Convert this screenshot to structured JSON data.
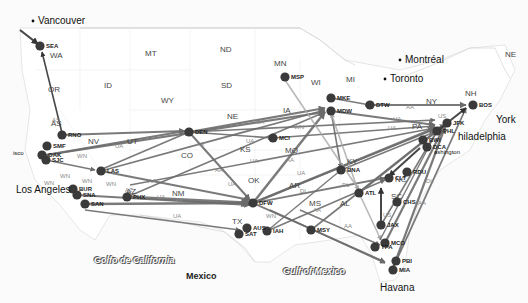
{
  "map": {
    "title": "US airline route network",
    "colors": {
      "route": "#6b6b6b",
      "route_dark": "#333333",
      "route_light": "#a8a8a8",
      "airport": "#3a3a3a",
      "border": "#cfcfcf"
    },
    "states": [
      {
        "label": "WA",
        "x": 50,
        "y": 52
      },
      {
        "label": "OR",
        "x": 48,
        "y": 86
      },
      {
        "label": "ID",
        "x": 104,
        "y": 82
      },
      {
        "label": "MT",
        "x": 145,
        "y": 50
      },
      {
        "label": "ND",
        "x": 220,
        "y": 46
      },
      {
        "label": "SD",
        "x": 221,
        "y": 82
      },
      {
        "label": "WY",
        "x": 161,
        "y": 97
      },
      {
        "label": "MN",
        "x": 274,
        "y": 60
      },
      {
        "label": "WI",
        "x": 311,
        "y": 79
      },
      {
        "label": "MI",
        "x": 346,
        "y": 76
      },
      {
        "label": "NE",
        "x": 227,
        "y": 113
      },
      {
        "label": "IA",
        "x": 283,
        "y": 107
      },
      {
        "label": "UT",
        "x": 127,
        "y": 138
      },
      {
        "label": "NV",
        "x": 88,
        "y": 138
      },
      {
        "label": "CO",
        "x": 181,
        "y": 152
      },
      {
        "label": "KS",
        "x": 240,
        "y": 146
      },
      {
        "label": "MO",
        "x": 285,
        "y": 147
      },
      {
        "label": "OK",
        "x": 248,
        "y": 177
      },
      {
        "label": "AR",
        "x": 289,
        "y": 182
      },
      {
        "label": "AZ",
        "x": 126,
        "y": 188
      },
      {
        "label": "NM",
        "x": 172,
        "y": 190
      },
      {
        "label": "TX",
        "x": 232,
        "y": 218
      },
      {
        "label": "MS",
        "x": 309,
        "y": 200
      },
      {
        "label": "AL",
        "x": 340,
        "y": 200
      },
      {
        "label": "KY",
        "x": 347,
        "y": 158
      },
      {
        "label": "SC",
        "x": 391,
        "y": 193
      },
      {
        "label": "NY",
        "x": 426,
        "y": 98
      },
      {
        "label": "PA",
        "x": 412,
        "y": 123
      },
      {
        "label": "NH",
        "x": 465,
        "y": 90
      },
      {
        "label": "NE",
        "x": 505,
        "y": 51
      },
      {
        "label": "AS",
        "x": 51,
        "y": 120
      },
      {
        "label": "NC",
        "x": 395,
        "y": 176
      }
    ],
    "cities": [
      {
        "label": "Vancouver",
        "x": 38,
        "y": 21,
        "dot": true
      },
      {
        "label": "Montréal",
        "x": 405,
        "y": 60,
        "dot": true
      },
      {
        "label": "Toronto",
        "x": 390,
        "y": 79,
        "dot": true
      },
      {
        "label": "York",
        "x": 496,
        "y": 120
      },
      {
        "label": "hiladelphia",
        "x": 458,
        "y": 137
      },
      {
        "label": "ashington",
        "x": 434,
        "y": 154,
        "small": true
      },
      {
        "label": "isco",
        "x": 13,
        "y": 155,
        "small": true
      },
      {
        "label": "Los Angeles",
        "x": 16,
        "y": 190
      },
      {
        "label": "Havana",
        "x": 380,
        "y": 288
      }
    ],
    "water": [
      {
        "label": "Golfo de California",
        "x": 94,
        "y": 256
      },
      {
        "label": "Gulf of Mexico",
        "x": 283,
        "y": 267
      }
    ],
    "countries": [
      {
        "label": "Mexico",
        "x": 186,
        "y": 272
      }
    ],
    "airports": [
      {
        "code": "SEA",
        "x": 40,
        "y": 46
      },
      {
        "code": "RNO",
        "x": 62,
        "y": 135
      },
      {
        "code": "SMF",
        "x": 47,
        "y": 146
      },
      {
        "code": "OAK",
        "x": 42,
        "y": 155
      },
      {
        "code": "SJC",
        "x": 46,
        "y": 160
      },
      {
        "code": "LAS",
        "x": 101,
        "y": 171
      },
      {
        "code": "BUR",
        "x": 73,
        "y": 189
      },
      {
        "code": "SNA",
        "x": 77,
        "y": 195
      },
      {
        "code": "SAN",
        "x": 85,
        "y": 204
      },
      {
        "code": "PHX",
        "x": 127,
        "y": 197
      },
      {
        "code": "DEN",
        "x": 189,
        "y": 132
      },
      {
        "code": "MCI",
        "x": 273,
        "y": 138
      },
      {
        "code": "MSP",
        "x": 285,
        "y": 77
      },
      {
        "code": "MKE",
        "x": 331,
        "y": 98
      },
      {
        "code": "MDW",
        "x": 331,
        "y": 111
      },
      {
        "code": "DTW",
        "x": 370,
        "y": 105
      },
      {
        "code": "BOS",
        "x": 473,
        "y": 105
      },
      {
        "code": "JFK",
        "x": 447,
        "y": 123
      },
      {
        "code": "PHL",
        "x": 437,
        "y": 131
      },
      {
        "code": "BWI",
        "x": 423,
        "y": 140
      },
      {
        "code": "DCA",
        "x": 427,
        "y": 147
      },
      {
        "code": "BNA",
        "x": 341,
        "y": 170
      },
      {
        "code": "RDU",
        "x": 407,
        "y": 172
      },
      {
        "code": "CLT",
        "x": 389,
        "y": 178
      },
      {
        "code": "ATL",
        "x": 359,
        "y": 193
      },
      {
        "code": "CHS",
        "x": 397,
        "y": 202
      },
      {
        "code": "JAX",
        "x": 381,
        "y": 225
      },
      {
        "code": "MCO",
        "x": 385,
        "y": 243
      },
      {
        "code": "TPA",
        "x": 375,
        "y": 247
      },
      {
        "code": "PBI",
        "x": 396,
        "y": 261
      },
      {
        "code": "MIA",
        "x": 393,
        "y": 270
      },
      {
        "code": "DFW",
        "x": 253,
        "y": 203
      },
      {
        "code": "AUS",
        "x": 247,
        "y": 228
      },
      {
        "code": "SAT",
        "x": 239,
        "y": 234
      },
      {
        "code": "IAH",
        "x": 267,
        "y": 231
      },
      {
        "code": "MSY",
        "x": 311,
        "y": 230
      }
    ],
    "carrier_labels": [
      {
        "label": "AS",
        "x": 52,
        "y": 117
      },
      {
        "label": "UA",
        "x": 115,
        "y": 143
      },
      {
        "label": "WN",
        "x": 77,
        "y": 153
      },
      {
        "label": "WN",
        "x": 60,
        "y": 173
      },
      {
        "label": "WN",
        "x": 44,
        "y": 180
      },
      {
        "label": "WN",
        "x": 82,
        "y": 178
      },
      {
        "label": "WN",
        "x": 106,
        "y": 181
      },
      {
        "label": "AA",
        "x": 148,
        "y": 178
      },
      {
        "label": "AZ",
        "x": 125,
        "y": 187
      },
      {
        "label": "UA",
        "x": 157,
        "y": 194
      },
      {
        "label": "AA",
        "x": 175,
        "y": 197
      },
      {
        "label": "UA",
        "x": 173,
        "y": 213
      },
      {
        "label": "UA",
        "x": 256,
        "y": 119
      },
      {
        "label": "AA",
        "x": 196,
        "y": 141
      },
      {
        "label": "UA",
        "x": 246,
        "y": 138
      },
      {
        "label": "WN",
        "x": 294,
        "y": 124
      },
      {
        "label": "UA",
        "x": 250,
        "y": 158
      },
      {
        "label": "AA",
        "x": 286,
        "y": 157
      },
      {
        "label": "UA",
        "x": 297,
        "y": 170
      },
      {
        "label": "AA",
        "x": 215,
        "y": 167
      },
      {
        "label": "UA",
        "x": 228,
        "y": 181
      },
      {
        "label": "DL",
        "x": 300,
        "y": 188
      },
      {
        "label": "UA",
        "x": 393,
        "y": 116
      },
      {
        "label": "UA",
        "x": 388,
        "y": 125
      },
      {
        "label": "AA",
        "x": 406,
        "y": 104
      },
      {
        "label": "US",
        "x": 438,
        "y": 113
      },
      {
        "label": "US",
        "x": 383,
        "y": 212
      },
      {
        "label": "AA",
        "x": 418,
        "y": 200
      },
      {
        "label": "WN",
        "x": 266,
        "y": 213
      },
      {
        "label": "DL",
        "x": 342,
        "y": 182
      },
      {
        "label": "AA",
        "x": 313,
        "y": 207
      },
      {
        "label": "AA",
        "x": 344,
        "y": 223
      },
      {
        "label": "DL",
        "x": 426,
        "y": 178
      }
    ],
    "routes": [
      {
        "from": [
          20,
          30
        ],
        "to": [
          38,
          44
        ],
        "w": 2.2,
        "c": "dark"
      },
      {
        "from": [
          62,
          133
        ],
        "to": [
          42,
          52
        ],
        "w": 1.6,
        "c": "dark"
      },
      {
        "from": [
          62,
          135
        ],
        "to": [
          185,
          131
        ],
        "w": 2,
        "c": "mid"
      },
      {
        "from": [
          46,
          155
        ],
        "to": [
          185,
          131
        ],
        "w": 2,
        "c": "mid"
      },
      {
        "from": [
          46,
          160
        ],
        "to": [
          95,
          170
        ],
        "w": 1.6,
        "c": "mid"
      },
      {
        "from": [
          46,
          155
        ],
        "to": [
          325,
          112
        ],
        "w": 2.2,
        "c": "mid"
      },
      {
        "from": [
          101,
          171
        ],
        "to": [
          325,
          110
        ],
        "w": 1.8,
        "c": "mid"
      },
      {
        "from": [
          101,
          171
        ],
        "to": [
          250,
          200
        ],
        "w": 2,
        "c": "mid"
      },
      {
        "from": [
          85,
          204
        ],
        "to": [
          250,
          203
        ],
        "w": 2.4,
        "c": "mid"
      },
      {
        "from": [
          127,
          197
        ],
        "to": [
          250,
          203
        ],
        "w": 3,
        "c": "mid"
      },
      {
        "from": [
          77,
          195
        ],
        "to": [
          250,
          205
        ],
        "w": 2,
        "c": "mid"
      },
      {
        "from": [
          127,
          197
        ],
        "to": [
          325,
          112
        ],
        "w": 1.6,
        "c": "mid"
      },
      {
        "from": [
          85,
          210
        ],
        "to": [
          240,
          230
        ],
        "w": 1.6,
        "c": "mid"
      },
      {
        "from": [
          189,
          132
        ],
        "to": [
          250,
          200
        ],
        "w": 2,
        "c": "mid"
      },
      {
        "from": [
          189,
          132
        ],
        "to": [
          325,
          108
        ],
        "w": 2.2,
        "c": "mid"
      },
      {
        "from": [
          189,
          132
        ],
        "to": [
          435,
          120
        ],
        "w": 1.6,
        "c": "mid"
      },
      {
        "from": [
          100,
          170
        ],
        "to": [
          189,
          132
        ],
        "w": 1.6,
        "c": "mid"
      },
      {
        "from": [
          189,
          132
        ],
        "to": [
          273,
          138
        ],
        "w": 1.6,
        "c": "mid"
      },
      {
        "from": [
          130,
          185
        ],
        "to": [
          435,
          128
        ],
        "w": 1.6,
        "c": "mid"
      },
      {
        "from": [
          273,
          138
        ],
        "to": [
          435,
          126
        ],
        "w": 1.6,
        "c": "mid"
      },
      {
        "from": [
          253,
          203
        ],
        "to": [
          325,
          112
        ],
        "w": 2.4,
        "c": "mid"
      },
      {
        "from": [
          253,
          203
        ],
        "to": [
          435,
          128
        ],
        "w": 2.4,
        "c": "mid"
      },
      {
        "from": [
          253,
          203
        ],
        "to": [
          445,
          125
        ],
        "w": 1.8,
        "c": "mid"
      },
      {
        "from": [
          253,
          203
        ],
        "to": [
          385,
          178
        ],
        "w": 1.8,
        "c": "mid"
      },
      {
        "from": [
          253,
          203
        ],
        "to": [
          385,
          262
        ],
        "w": 1.8,
        "c": "mid"
      },
      {
        "from": [
          267,
          231
        ],
        "to": [
          385,
          180
        ],
        "w": 1.6,
        "c": "mid"
      },
      {
        "from": [
          311,
          230
        ],
        "to": [
          440,
          128
        ],
        "w": 1.6,
        "c": "mid"
      },
      {
        "from": [
          267,
          231
        ],
        "to": [
          341,
          170
        ],
        "w": 1.4,
        "c": "mid"
      },
      {
        "from": [
          331,
          111
        ],
        "to": [
          435,
          125
        ],
        "w": 2.2,
        "c": "mid"
      },
      {
        "from": [
          331,
          98
        ],
        "to": [
          370,
          105
        ],
        "w": 1.6,
        "c": "mid"
      },
      {
        "from": [
          370,
          105
        ],
        "to": [
          466,
          105
        ],
        "w": 2.2,
        "c": "mid"
      },
      {
        "from": [
          331,
          111
        ],
        "to": [
          341,
          168
        ],
        "w": 1.6,
        "c": "mid"
      },
      {
        "from": [
          285,
          80
        ],
        "to": [
          359,
          190
        ],
        "w": 1.6,
        "c": "light"
      },
      {
        "from": [
          341,
          170
        ],
        "to": [
          437,
          131
        ],
        "w": 1.6,
        "c": "mid"
      },
      {
        "from": [
          359,
          193
        ],
        "to": [
          437,
          131
        ],
        "w": 1.8,
        "c": "mid"
      },
      {
        "from": [
          359,
          193
        ],
        "to": [
          331,
          113
        ],
        "w": 1.6,
        "c": "light"
      },
      {
        "from": [
          385,
          243
        ],
        "to": [
          445,
          125
        ],
        "w": 2.2,
        "c": "mid"
      },
      {
        "from": [
          393,
          268
        ],
        "to": [
          445,
          127
        ],
        "w": 2.2,
        "c": "mid"
      },
      {
        "from": [
          393,
          268
        ],
        "to": [
          466,
          108
        ],
        "w": 1.8,
        "c": "mid"
      },
      {
        "from": [
          420,
          148
        ],
        "to": [
          389,
          176
        ],
        "w": 2,
        "c": "dark"
      },
      {
        "from": [
          381,
          225
        ],
        "to": [
          381,
          188
        ],
        "w": 2,
        "c": "dark"
      },
      {
        "from": [
          437,
          131
        ],
        "to": [
          466,
          108
        ],
        "w": 2,
        "c": "dark"
      },
      {
        "from": [
          300,
          210
        ],
        "to": [
          380,
          245
        ],
        "w": 1.6,
        "c": "mid"
      },
      {
        "from": [
          270,
          210
        ],
        "to": [
          385,
          263
        ],
        "w": 1.6,
        "c": "mid"
      },
      {
        "from": [
          359,
          193
        ],
        "to": [
          381,
          240
        ],
        "w": 1.6,
        "c": "light"
      },
      {
        "from": [
          437,
          131
        ],
        "to": [
          381,
          225
        ],
        "w": 1.6,
        "c": "mid"
      },
      {
        "from": [
          380,
          240
        ],
        "to": [
          437,
          131
        ],
        "w": 1.4,
        "c": "mid"
      }
    ]
  }
}
